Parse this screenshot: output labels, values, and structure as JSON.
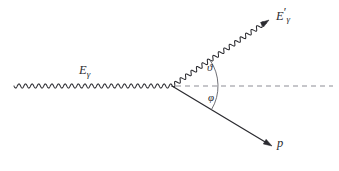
{
  "figure": {
    "background_color": "#ffffff",
    "line_color": "#2b2b30",
    "axis_color": "#8e8e96",
    "arc_color": "#55555c",
    "width": 339,
    "height": 171
  },
  "labels": {
    "incident_photon": {
      "symbol": "E",
      "subscript": "γ",
      "prime": "",
      "full_text": "Eγ",
      "name": "incident-photon-energy"
    },
    "scattered_photon": {
      "symbol": "E",
      "subscript": "γ",
      "prime": "′",
      "full_text": "E′γ",
      "name": "scattered-photon-energy"
    },
    "proton": {
      "symbol": "p",
      "subscript": "",
      "prime": "",
      "full_text": "p",
      "name": "recoil-proton-momentum"
    },
    "scattering_angle": {
      "symbol": "ϑ",
      "full_text": "ϑ",
      "name": "photon-scattering-angle"
    },
    "recoil_angle": {
      "symbol": "φ",
      "full_text": "φ",
      "name": "proton-recoil-angle"
    }
  },
  "geometry": {
    "vertex": {
      "x": 172,
      "y": 86
    },
    "incident_photon_start": {
      "x": 14,
      "y": 86
    },
    "scattered_photon_end": {
      "x": 269,
      "y": 20
    },
    "proton_end": {
      "x": 272,
      "y": 146
    },
    "axis_start": {
      "x": 176,
      "y": 86
    },
    "axis_end": {
      "x": 333,
      "y": 86
    },
    "arc_radius": 46,
    "scattering_angle_deg": 34.5,
    "recoil_angle_deg": 31.0,
    "wave_amplitude": 2.1,
    "wave_period": 6.6
  },
  "elements": {
    "incident_photon_line": "wavy-horizontal-line",
    "scattered_photon_line": "wavy-diagonal-line-up-right",
    "proton_line": "straight-diagonal-arrow-down-right",
    "reference_axis": "horizontal-dashed-line",
    "angle_arc": "single-arc-spanning-both-angles"
  }
}
